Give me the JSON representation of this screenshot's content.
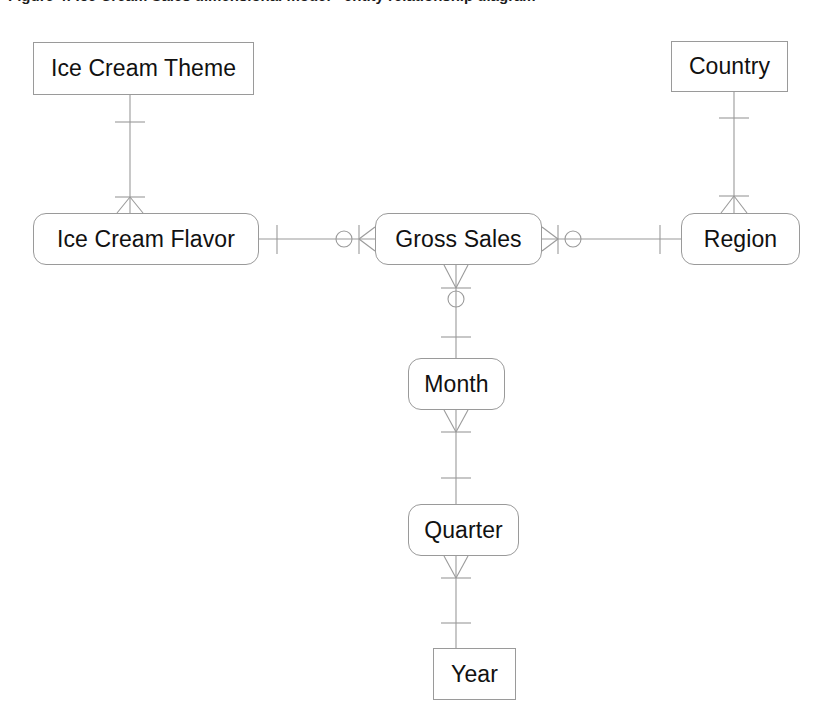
{
  "diagram": {
    "type": "entity-relationship-diagram",
    "notation": "crow's foot (information engineering)",
    "caption_partial": "Figure 4: Ice Cream Sales dimensional model - entity relationship diagram",
    "line_color": "#9a9a9a",
    "text_color": "#111111",
    "background_color": "#ffffff",
    "entities": [
      {
        "id": "ice-cream-theme",
        "label": "Ice Cream Theme",
        "shape": "rectangle",
        "x": 33,
        "y": 42,
        "width": 221,
        "height": 53
      },
      {
        "id": "country",
        "label": "Country",
        "shape": "rectangle",
        "x": 671,
        "y": 41,
        "width": 117,
        "height": 51
      },
      {
        "id": "ice-cream-flavor",
        "label": "Ice Cream Flavor",
        "shape": "rounded-rectangle",
        "x": 33,
        "y": 213,
        "width": 226,
        "height": 52
      },
      {
        "id": "gross-sales",
        "label": "Gross Sales",
        "shape": "rounded-rectangle",
        "x": 375,
        "y": 213,
        "width": 167,
        "height": 52
      },
      {
        "id": "region",
        "label": "Region",
        "shape": "rounded-rectangle",
        "x": 681,
        "y": 213,
        "width": 119,
        "height": 52
      },
      {
        "id": "month",
        "label": "Month",
        "shape": "rounded-rectangle",
        "x": 408,
        "y": 358,
        "width": 97,
        "height": 52
      },
      {
        "id": "quarter",
        "label": "Quarter",
        "shape": "rounded-rectangle",
        "x": 408,
        "y": 504,
        "width": 111,
        "height": 52
      },
      {
        "id": "year",
        "label": "Year",
        "shape": "rectangle",
        "x": 433,
        "y": 648,
        "width": 83,
        "height": 52
      }
    ],
    "relationships": [
      {
        "id": "theme-flavor",
        "from": "ice-cream-theme",
        "to": "ice-cream-flavor",
        "from_cardinality": "exactly-one",
        "to_cardinality": "one-or-many",
        "orientation": "vertical"
      },
      {
        "id": "flavor-sales",
        "from": "ice-cream-flavor",
        "to": "gross-sales",
        "from_cardinality": "exactly-one",
        "to_cardinality": "zero-or-many",
        "orientation": "horizontal"
      },
      {
        "id": "sales-region",
        "from": "gross-sales",
        "to": "region",
        "from_cardinality": "zero-or-many",
        "to_cardinality": "exactly-one",
        "orientation": "horizontal"
      },
      {
        "id": "country-region",
        "from": "country",
        "to": "region",
        "from_cardinality": "exactly-one",
        "to_cardinality": "one-or-many",
        "orientation": "vertical"
      },
      {
        "id": "sales-month",
        "from": "gross-sales",
        "to": "month",
        "from_cardinality": "zero-or-many",
        "to_cardinality": "exactly-one",
        "orientation": "vertical"
      },
      {
        "id": "month-quarter",
        "from": "month",
        "to": "quarter",
        "from_cardinality": "one-or-many",
        "to_cardinality": "exactly-one",
        "orientation": "vertical"
      },
      {
        "id": "quarter-year",
        "from": "quarter",
        "to": "year",
        "from_cardinality": "one-or-many",
        "to_cardinality": "exactly-one",
        "orientation": "vertical"
      }
    ]
  }
}
